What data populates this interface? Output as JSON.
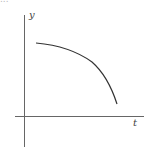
{
  "header": {
    "cutoff_text": "..."
  },
  "diagram": {
    "type": "graph-sketch",
    "axes": {
      "x_label": "t",
      "y_label": "y"
    },
    "curve": {
      "description": "concave-down decreasing curve",
      "color": "#333333"
    },
    "colors": {
      "axis": "#555555",
      "background": "#ffffff"
    }
  }
}
